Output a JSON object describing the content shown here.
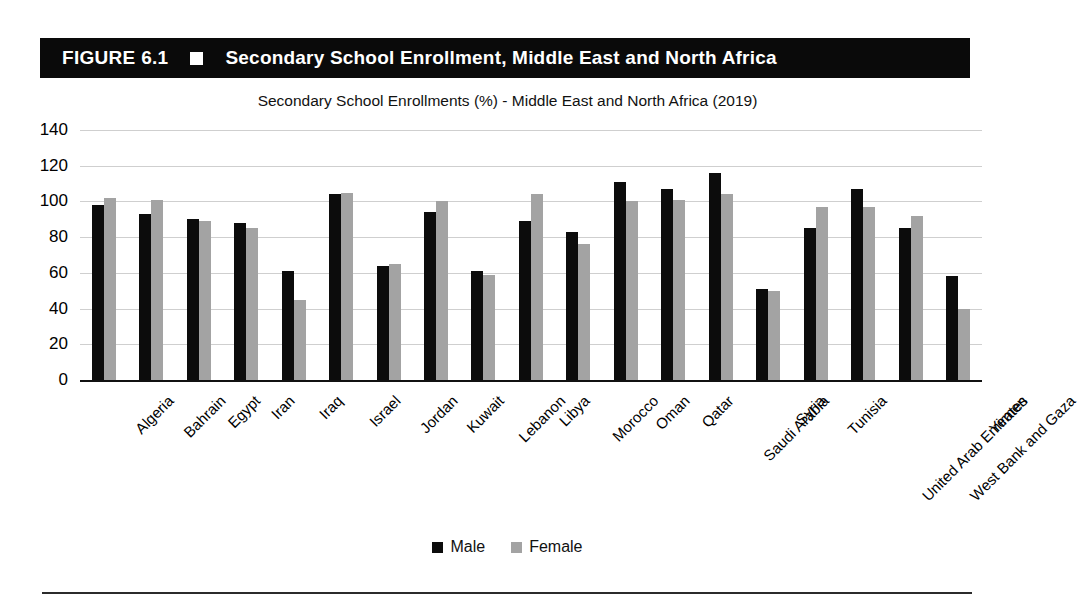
{
  "figure": {
    "number": "FIGURE 6.1",
    "bullet_icon": "filled-square-icon",
    "caption": "Secondary School Enrollment, Middle East and North Africa"
  },
  "chart_data": {
    "type": "bar",
    "title": "Secondary School Enrollments (%) - Middle East and North Africa (2019)",
    "xlabel": "",
    "ylabel": "",
    "ylim": [
      0,
      140
    ],
    "ytick_step": 20,
    "yticks": [
      140,
      120,
      100,
      80,
      60,
      40,
      20,
      0
    ],
    "grid": true,
    "legend_position": "bottom-center",
    "colors": {
      "male": "#0c0c0c",
      "female": "#a3a3a3"
    },
    "categories": [
      "Algeria",
      "Bahrain",
      "Egypt",
      "Iran",
      "Iraq",
      "Israel",
      "Jordan",
      "Kuwait",
      "Lebanon",
      "Libya",
      "Morocco",
      "Oman",
      "Qatar",
      "Saudi Arabia",
      "Syria",
      "Tunisia",
      "United Arab Emirates",
      "West Bank and Gaza",
      "Yemen"
    ],
    "series": [
      {
        "name": "Male",
        "values": [
          98,
          93,
          90,
          88,
          61,
          104,
          64,
          94,
          61,
          89,
          83,
          111,
          107,
          116,
          51,
          85,
          107,
          85,
          58
        ]
      },
      {
        "name": "Female",
        "values": [
          102,
          101,
          89,
          85,
          45,
          105,
          65,
          100,
          59,
          104,
          76,
          100,
          101,
          104,
          50,
          97,
          97,
          92,
          40
        ]
      }
    ]
  }
}
